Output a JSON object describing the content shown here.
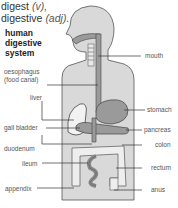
{
  "headword": {
    "line1_word": "digest",
    "line1_pos": "(v),",
    "line2_word": "digestive",
    "line2_pos": "(adj)."
  },
  "diagram": {
    "title_lines": [
      "human",
      "digestive",
      "system"
    ],
    "labels_left": [
      {
        "text": "oesophagus",
        "key": "oesophagus_1"
      },
      {
        "text": "(food canal)",
        "key": "oesophagus_2"
      },
      {
        "text": "liver"
      },
      {
        "text": "gall bladder"
      },
      {
        "text": "duodenum"
      },
      {
        "text": "ileum"
      },
      {
        "text": "appendix"
      }
    ],
    "labels_right": [
      {
        "text": "mouth"
      },
      {
        "text": "stomach"
      },
      {
        "text": "pancreas"
      },
      {
        "text": "colon"
      },
      {
        "text": "rectum"
      },
      {
        "text": "anus"
      }
    ],
    "colors": {
      "body_fill": "#d9d9d9",
      "organ_fill": "#9a9a9a",
      "liver_fill": "#f2f2f2",
      "outline": "#444444",
      "leader_line": "#333333"
    }
  }
}
